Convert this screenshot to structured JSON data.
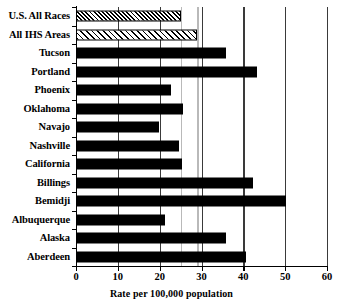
{
  "chart_data": {
    "type": "bar",
    "orientation": "horizontal",
    "title": "",
    "xlabel": "Rate per 100,000 population",
    "ylabel": "",
    "xlim": [
      0,
      60
    ],
    "xticks": [
      0,
      10,
      20,
      30,
      40,
      50,
      60
    ],
    "xtick_labels": [
      "0",
      "10",
      "20",
      "30",
      "40",
      "50",
      "60"
    ],
    "grid": true,
    "gridlines_x": [
      10,
      20,
      30,
      40,
      50,
      60
    ],
    "reference_lines": [
      25.1,
      29.0
    ],
    "legend": null,
    "categories": [
      "U.S. All Races",
      "All IHS Areas",
      "Tucson",
      "Portland",
      "Phoenix",
      "Oklahoma",
      "Navajo",
      "Nashville",
      "California",
      "Billings",
      "Bemidji",
      "Albuquerque",
      "Alaska",
      "Aberdeen"
    ],
    "values": [
      25.1,
      29.0,
      35.9,
      43.3,
      22.7,
      25.6,
      19.8,
      24.6,
      25.3,
      42.3,
      50.3,
      21.3,
      35.9,
      40.7
    ],
    "bar_styles": [
      "hatch-check",
      "hatch-diag",
      "solid",
      "solid",
      "solid",
      "solid",
      "solid",
      "solid",
      "solid",
      "solid",
      "solid",
      "solid",
      "solid",
      "solid"
    ],
    "colors": {
      "bar": "#000000",
      "axis": "#000000",
      "gridline": "#3a3a3a",
      "reference_line": "#b9b9b9",
      "background": "#ffffff"
    }
  }
}
